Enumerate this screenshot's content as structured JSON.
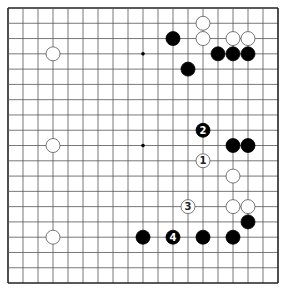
{
  "board": {
    "size": 19,
    "origin_x": 8,
    "origin_y": 8,
    "spacing_x": 15,
    "spacing_y": 15.28,
    "stone_radius": 7,
    "line_color": "#555555",
    "border_color": "#222222",
    "background": "#ffffff",
    "black_color": "#000000",
    "white_fill": "#ffffff",
    "white_stroke": "#555555",
    "star_points": [
      [
        9,
        3
      ],
      [
        9,
        9
      ]
    ]
  },
  "stones": [
    {
      "color": "white",
      "col": 13,
      "row": 1
    },
    {
      "color": "white",
      "col": 13,
      "row": 2
    },
    {
      "color": "black",
      "col": 11,
      "row": 2
    },
    {
      "color": "white",
      "col": 15,
      "row": 2
    },
    {
      "color": "white",
      "col": 16,
      "row": 2
    },
    {
      "color": "black",
      "col": 14,
      "row": 3
    },
    {
      "color": "black",
      "col": 15,
      "row": 3
    },
    {
      "color": "black",
      "col": 16,
      "row": 3
    },
    {
      "color": "black",
      "col": 12,
      "row": 4
    },
    {
      "color": "white",
      "col": 3,
      "row": 3
    },
    {
      "color": "white",
      "col": 3,
      "row": 9
    },
    {
      "color": "black",
      "col": 13,
      "row": 8,
      "label": "2"
    },
    {
      "color": "black",
      "col": 15,
      "row": 9
    },
    {
      "color": "black",
      "col": 16,
      "row": 9
    },
    {
      "color": "white",
      "col": 13,
      "row": 10,
      "label": "1"
    },
    {
      "color": "white",
      "col": 15,
      "row": 11
    },
    {
      "color": "white",
      "col": 12,
      "row": 13,
      "label": "3"
    },
    {
      "color": "white",
      "col": 15,
      "row": 13
    },
    {
      "color": "white",
      "col": 16,
      "row": 13
    },
    {
      "color": "black",
      "col": 16,
      "row": 14
    },
    {
      "color": "black",
      "col": 9,
      "row": 15
    },
    {
      "color": "black",
      "col": 11,
      "row": 15,
      "label": "4"
    },
    {
      "color": "black",
      "col": 13,
      "row": 15
    },
    {
      "color": "black",
      "col": 15,
      "row": 15
    },
    {
      "color": "white",
      "col": 3,
      "row": 15
    }
  ]
}
